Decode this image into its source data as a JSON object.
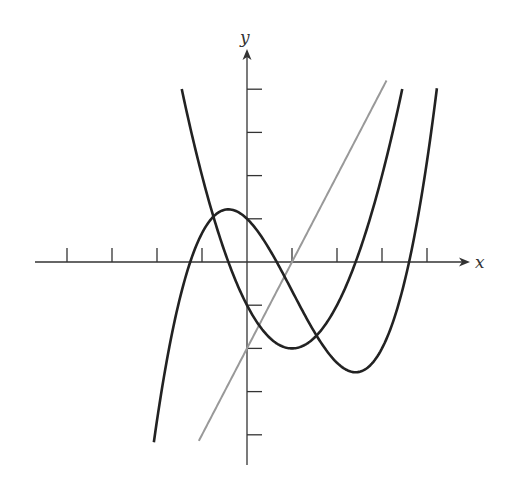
{
  "chart_data": {
    "type": "line",
    "title": "",
    "xlabel": "x",
    "ylabel": "y",
    "xlim": [
      -4.5,
      5.0
    ],
    "ylim": [
      -4.6,
      4.8
    ],
    "grid": false,
    "legend": null,
    "x_ticks": [
      -4,
      -3,
      -2,
      -1,
      1,
      2,
      3,
      4
    ],
    "y_ticks": [
      -4,
      -3,
      -2,
      -1,
      1,
      2,
      3,
      4
    ],
    "tick_labels_shown": false,
    "series": [
      {
        "name": "cubic curve",
        "color": "#222222",
        "formula_estimate": "y = x^3/3 - x^2 - x + 1",
        "x_range": [
          -2.07,
          4.22
        ],
        "key_points": {
          "local_max": [
            -0.41,
            1.22
          ],
          "local_min": [
            2.41,
            -2.55
          ],
          "y_intercept": 1.0,
          "x_intercepts": [
            -1.29,
            0.69,
            3.6
          ]
        }
      },
      {
        "name": "parabola",
        "color": "#222222",
        "formula_estimate": "y = x^2 - 2x - 1",
        "x_range": [
          -1.45,
          3.45
        ],
        "key_points": {
          "vertex": [
            1.0,
            -2.0
          ],
          "y_intercept": -1.0,
          "x_intercepts": [
            -0.41,
            2.41
          ]
        }
      },
      {
        "name": "line",
        "color": "#999999",
        "formula_estimate": "y = 2x - 2",
        "x_range": [
          -1.07,
          3.1
        ],
        "key_points": {
          "y_intercept": -2.0,
          "x_intercept": 1.0
        }
      }
    ]
  },
  "axes": {
    "x_label": "x",
    "y_label": "y"
  },
  "layout": {
    "origin_px": [
      247,
      262
    ],
    "unit_x_px": 45,
    "unit_y_px": 43.2
  }
}
